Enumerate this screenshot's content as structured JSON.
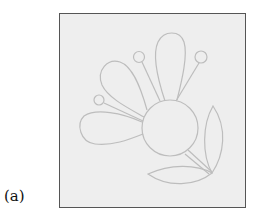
{
  "figure": {
    "label": "(a)",
    "colors": {
      "frame_background": "#eeeeee",
      "frame_border": "#555555",
      "line": "#bdbdbd"
    }
  }
}
